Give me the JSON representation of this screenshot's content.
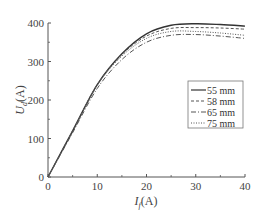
{
  "chart_data": {
    "type": "line",
    "title": "",
    "xlabel": "I_f(A)",
    "xlabel_main": "I",
    "xlabel_sub": "f",
    "xlabel_unit": "(A)",
    "ylabel": "U_d(A)",
    "ylabel_main": "U",
    "ylabel_sub": "d",
    "ylabel_unit": "(A)",
    "xlim": [
      0,
      40
    ],
    "ylim": [
      0,
      400
    ],
    "xticks": [
      0,
      10,
      20,
      30,
      40
    ],
    "yticks": [
      0,
      100,
      200,
      300,
      400
    ],
    "grid": false,
    "legend_position": "center-right",
    "x": [
      0,
      5,
      10,
      15,
      20,
      25,
      30,
      35,
      40
    ],
    "series": [
      {
        "name": "55 mm",
        "style": "solid",
        "values": [
          0,
          120,
          240,
          320,
          372,
          394,
          398,
          396,
          392
        ]
      },
      {
        "name": "58 mm",
        "style": "dashed",
        "values": [
          0,
          120,
          240,
          318,
          366,
          386,
          388,
          387,
          384
        ]
      },
      {
        "name": "65 mm",
        "style": "dashdot",
        "values": [
          0,
          115,
          230,
          305,
          350,
          368,
          370,
          366,
          360
        ]
      },
      {
        "name": "75 mm",
        "style": "dotted",
        "values": [
          0,
          118,
          238,
          314,
          360,
          378,
          378,
          374,
          368
        ]
      }
    ]
  },
  "legend": {
    "items": [
      "55 mm",
      "58 mm",
      "65 mm",
      "75 mm"
    ]
  },
  "xticks_labels": [
    "0",
    "10",
    "20",
    "30",
    "40"
  ],
  "yticks_labels": [
    "0",
    "100",
    "200",
    "300",
    "400"
  ]
}
